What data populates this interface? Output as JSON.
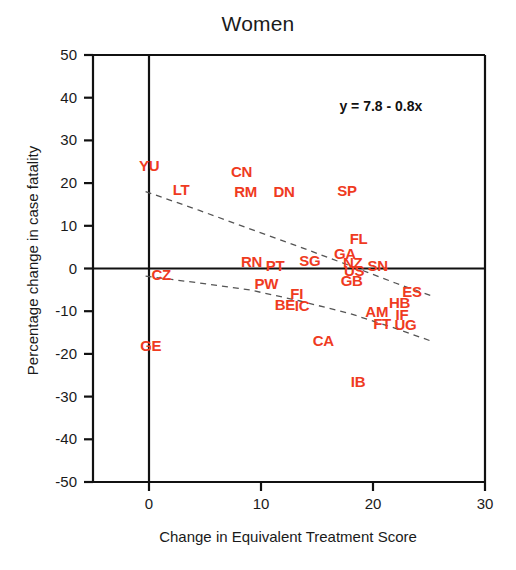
{
  "chart_data": {
    "type": "scatter",
    "title": "Women",
    "xlabel": "Change in Equivalent Treatment Score",
    "ylabel": "Percentage change in case fatality",
    "xlim": [
      -5,
      30
    ],
    "ylim": [
      -50,
      50
    ],
    "xticks": [
      "0",
      "10",
      "20",
      "30"
    ],
    "xtick_values": [
      0,
      10,
      20,
      30
    ],
    "yticks": [
      "50",
      "40",
      "30",
      "20",
      "10",
      "0",
      "-10",
      "-20",
      "-30",
      "-40",
      "-50"
    ],
    "ytick_values": [
      50,
      40,
      30,
      20,
      10,
      0,
      -10,
      -20,
      -30,
      -40,
      -50
    ],
    "grid": false,
    "legend": null,
    "annotation": "y = 7.8 - 0.8x",
    "marker_style": "text-label",
    "marker_color": "#ef3b1f",
    "axis_color": "#111111",
    "fit_line_style": "dashed confidence band",
    "points": [
      {
        "label": "YU",
        "x": 0.1,
        "y": 24.0
      },
      {
        "label": "LT",
        "x": 3.1,
        "y": 18.5
      },
      {
        "label": "CN",
        "x": 8.3,
        "y": 22.5
      },
      {
        "label": "RM",
        "x": 8.6,
        "y": 18.0
      },
      {
        "label": "DN",
        "x": 12.1,
        "y": 17.8
      },
      {
        "label": "SP",
        "x": 17.8,
        "y": 18.2
      },
      {
        "label": "FL",
        "x": 18.9,
        "y": 7.0
      },
      {
        "label": "GA",
        "x": 17.5,
        "y": 3.4
      },
      {
        "label": "SG",
        "x": 14.4,
        "y": 1.8
      },
      {
        "label": "SN",
        "x": 20.5,
        "y": 0.5
      },
      {
        "label": "NZ",
        "x": 18.3,
        "y": 1.4
      },
      {
        "label": "US",
        "x": 18.4,
        "y": -0.6
      },
      {
        "label": "RN",
        "x": 9.2,
        "y": 1.5
      },
      {
        "label": "PT",
        "x": 11.4,
        "y": 0.6
      },
      {
        "label": "CZ",
        "x": 1.2,
        "y": -1.6
      },
      {
        "label": "GB",
        "x": 18.1,
        "y": -3.0
      },
      {
        "label": "PW",
        "x": 10.4,
        "y": -3.6
      },
      {
        "label": "FI",
        "x": 13.6,
        "y": -6.0
      },
      {
        "label": "BE",
        "x": 12.2,
        "y": -8.5
      },
      {
        "label": "IC",
        "x": 14.0,
        "y": -8.8
      },
      {
        "label": "ES",
        "x": 23.6,
        "y": -5.5
      },
      {
        "label": "HB",
        "x": 22.4,
        "y": -8.0
      },
      {
        "label": "AM",
        "x": 20.3,
        "y": -10.2
      },
      {
        "label": "IF",
        "x": 23.0,
        "y": -11.0
      },
      {
        "label": "FT",
        "x": 21.0,
        "y": -13.0
      },
      {
        "label": "UG",
        "x": 22.9,
        "y": -13.2
      },
      {
        "label": "CA",
        "x": 15.6,
        "y": -17.0
      },
      {
        "label": "GE",
        "x": 0.2,
        "y": -18.2
      },
      {
        "label": "IB",
        "x": 19.0,
        "y": -26.5
      }
    ],
    "upper_band": [
      {
        "x": -0.3,
        "y": 18.0
      },
      {
        "x": 4.5,
        "y": 13.6
      },
      {
        "x": 9.0,
        "y": 9.3
      },
      {
        "x": 13.5,
        "y": 5.0
      },
      {
        "x": 18.0,
        "y": 0.6
      },
      {
        "x": 22.0,
        "y": -3.4
      },
      {
        "x": 25.2,
        "y": -6.4
      }
    ],
    "lower_band": [
      {
        "x": -0.3,
        "y": -1.8
      },
      {
        "x": 4.5,
        "y": -3.4
      },
      {
        "x": 9.0,
        "y": -5.0
      },
      {
        "x": 13.5,
        "y": -7.6
      },
      {
        "x": 18.0,
        "y": -10.6
      },
      {
        "x": 22.0,
        "y": -14.0
      },
      {
        "x": 25.2,
        "y": -17.0
      }
    ]
  }
}
